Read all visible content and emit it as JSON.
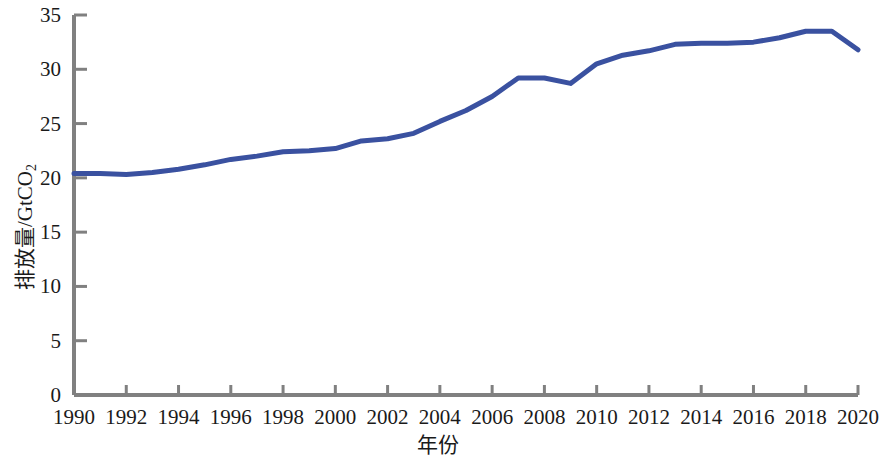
{
  "chart_data": {
    "type": "line",
    "title": "",
    "xlabel": "年份",
    "ylabel": "排放量/GtCO2",
    "ylabel_base": "排放量/GtCO",
    "ylabel_sub": "2",
    "xlim": [
      1990,
      2020
    ],
    "ylim": [
      0,
      35
    ],
    "grid": false,
    "legend": "none",
    "line_color": "#3a51a0",
    "axis_color": "#808080",
    "tick_color": "#808080",
    "x_ticks": [
      1990,
      1992,
      1994,
      1996,
      1998,
      2000,
      2002,
      2004,
      2006,
      2008,
      2010,
      2012,
      2014,
      2016,
      2018,
      2020
    ],
    "x_tick_labels": [
      "1990",
      "1992",
      "1994",
      "1996",
      "1998",
      "2000",
      "2002",
      "2004",
      "2006",
      "2008",
      "2010",
      "2012",
      "2014",
      "2016",
      "2018",
      "2020"
    ],
    "y_ticks": [
      0,
      5,
      10,
      15,
      20,
      25,
      30,
      35
    ],
    "y_tick_labels": [
      "0",
      "5",
      "10",
      "15",
      "20",
      "25",
      "30",
      "35"
    ],
    "x": [
      1990,
      1991,
      1992,
      1993,
      1994,
      1995,
      1996,
      1997,
      1998,
      1999,
      2000,
      2001,
      2002,
      2003,
      2004,
      2005,
      2006,
      2007,
      2008,
      2009,
      2010,
      2011,
      2012,
      2013,
      2014,
      2015,
      2016,
      2017,
      2018,
      2019,
      2020
    ],
    "values": [
      20.4,
      20.4,
      20.3,
      20.5,
      20.8,
      21.2,
      21.7,
      22.0,
      22.4,
      22.5,
      22.7,
      23.4,
      23.6,
      24.1,
      25.2,
      26.2,
      27.5,
      29.2,
      29.2,
      28.7,
      30.5,
      31.3,
      31.7,
      32.3,
      32.4,
      32.4,
      32.5,
      32.9,
      33.5,
      33.5,
      31.8
    ],
    "series": [
      {
        "name": "全球二氧化碳排放量",
        "color": "#3a51a0",
        "values": [
          20.4,
          20.4,
          20.3,
          20.5,
          20.8,
          21.2,
          21.7,
          22.0,
          22.4,
          22.5,
          22.7,
          23.4,
          23.6,
          24.1,
          25.2,
          26.2,
          27.5,
          29.2,
          29.2,
          28.7,
          30.5,
          31.3,
          31.7,
          32.3,
          32.4,
          32.4,
          32.5,
          32.9,
          33.5,
          33.5,
          31.8
        ]
      }
    ]
  }
}
